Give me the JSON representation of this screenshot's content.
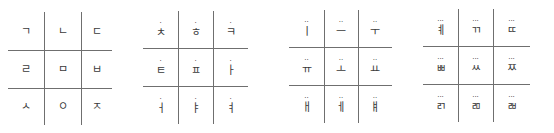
{
  "grids": [
    {
      "name": "consonant-grid",
      "marker": "",
      "rows": [
        [
          "ㄱ",
          "ㄴ",
          "ㄷ"
        ],
        [
          "ㄹ",
          "ㅁ",
          "ㅂ"
        ],
        [
          "ㅅ",
          "ㅇ",
          "ㅈ"
        ]
      ]
    },
    {
      "name": "one-dot-grid",
      "marker": "·",
      "rows": [
        [
          "ㅊ",
          "ㅎ",
          "ㅋ"
        ],
        [
          "ㅌ",
          "ㅍ",
          "ㅏ"
        ],
        [
          "ㅓ",
          "ㅑ",
          "ㅕ"
        ]
      ]
    },
    {
      "name": "two-dot-grid",
      "marker": "··",
      "rows": [
        [
          "ㅣ",
          "ㅡ",
          "ㅜ"
        ],
        [
          "ㅠ",
          "ㅗ",
          "ㅛ"
        ],
        [
          "ㅐ",
          "ㅔ",
          "ㅒ"
        ]
      ]
    },
    {
      "name": "three-dot-grid",
      "marker": "···",
      "rows": [
        [
          "ㅖ",
          "ㄲ",
          "ㄸ"
        ],
        [
          "ㅃ",
          "ㅆ",
          "ㅉ"
        ],
        [
          "ㄺ",
          "ㄻ",
          "ㄼ"
        ]
      ]
    }
  ],
  "layout": {
    "grids": [
      {
        "left": 8,
        "width": 104,
        "v": [
          36,
          73
        ],
        "h": [
          50,
          88
        ],
        "top": 12,
        "bottom": 125
      },
      {
        "left": 143,
        "width": 105,
        "v": [
          35,
          70
        ],
        "h": [
          48,
          86
        ],
        "top": 11,
        "bottom": 124
      },
      {
        "left": 289,
        "width": 103,
        "v": [
          35,
          69
        ],
        "h": [
          47,
          85
        ],
        "top": 10,
        "bottom": 123
      },
      {
        "left": 423,
        "width": 107,
        "v": [
          35,
          70
        ],
        "h": [
          46,
          84
        ],
        "top": 9,
        "bottom": 122
      }
    ]
  }
}
